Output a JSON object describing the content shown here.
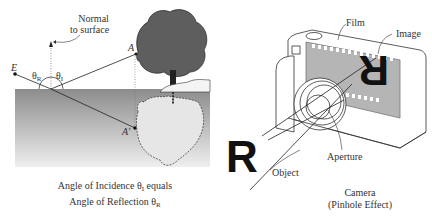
{
  "left_panel": {
    "normal_label_line1": "Normal",
    "normal_label_line2": "to surface",
    "point_eye": "E",
    "point_object": "A",
    "point_image": "A'",
    "theta": "θ",
    "theta_r_sub": "R",
    "theta_i_sub": "I",
    "caption_line1_a": "Angle of Incidence θ",
    "caption_line1_sub": "I",
    "caption_line1_b": " equals",
    "caption_line2_a": "Angle of Reflection θ",
    "caption_line2_sub": "R"
  },
  "right_panel": {
    "film_label": "Film",
    "image_label": "Image",
    "aperture_label": "Aperture",
    "object_label": "Object",
    "object_letter": "R",
    "caption_line1": "Camera",
    "caption_line2": "(Pinhole Effect)"
  },
  "colors": {
    "water_top": "#8e8e8e",
    "water_bottom": "#ededed",
    "tree": "#5a5a5a",
    "film": "#b5b5b5",
    "ink": "#1a1a1a"
  }
}
